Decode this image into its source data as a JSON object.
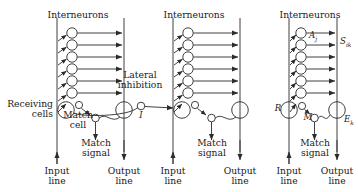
{
  "figure": {
    "type": "neural-network-diagram",
    "background": "#ffffff",
    "ink": "#2b2b2b",
    "modules": 3,
    "interneurons_per_module": 6
  },
  "labels": {
    "interneurons_1": "Interneurons",
    "interneurons_2": "Interneurons",
    "interneurons_3": "Interneurons",
    "receiving_cells": "Receiving\ncells",
    "match_cell_1": "Match\ncell",
    "match_signal_1": "Match\nsignal",
    "lateral_inhibition": "Lateral\ninhibition",
    "match_cell_2": "Match\nsignal",
    "match_signal_3": "Match\nsignal",
    "input_line_1": "Input\nline",
    "output_line_1": "Output\nline",
    "input_line_2": "Input\nline",
    "output_line_2": "Output\nline",
    "input_line_3": "Input\nline",
    "output_line_3": "Output\nline"
  },
  "symbols": {
    "inhibition_I": "I",
    "activity_A": "A",
    "activity_A_sub": "j",
    "signal_S": "S",
    "signal_S_sub": "ik",
    "receiving_R": "R",
    "match_M": "M",
    "output_E": "E",
    "output_E_sub": "k"
  }
}
